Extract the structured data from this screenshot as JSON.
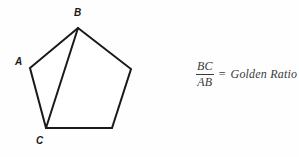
{
  "figure": {
    "shape_name": "pentagon",
    "stroke_color": "#1a1a1a",
    "fill_color": "#ffffff",
    "background_color": "#fefefe",
    "vertices": [
      {
        "label": "A",
        "x": 30,
        "y": 68
      },
      {
        "label": "B",
        "x": 78,
        "y": 28
      },
      {
        "label": "",
        "x": 131,
        "y": 69
      },
      {
        "label": "",
        "x": 112,
        "y": 128
      },
      {
        "label": "C",
        "x": 46,
        "y": 128
      }
    ],
    "outline_path": "M30,68 L78,28 L131,69 L112,128 L46,128 Z",
    "diagonal_path": "M78,28 L46,128",
    "labels": {
      "a": "A",
      "b": "B",
      "c": "C"
    }
  },
  "equation": {
    "numerator": "BC",
    "denominator": "AB",
    "equals": "=",
    "result": "Golden Ratio",
    "text_color": "#3a3a3a"
  }
}
